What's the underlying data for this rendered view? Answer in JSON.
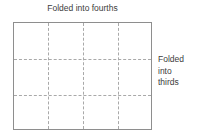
{
  "diagram": {
    "type": "folded-paper-grid",
    "background_color": "#ffffff",
    "top_caption": "Folded into fourths",
    "side_caption_lines": [
      "Folded",
      "into",
      "thirds"
    ],
    "paper": {
      "border_color": "#8e8e8e",
      "fill_color": "#ffffff",
      "fold_line_color": "#a9a9a9",
      "columns": 4,
      "rows": 3,
      "vertical_fold_count": 3,
      "horizontal_fold_count": 2,
      "total_cells": 12
    }
  }
}
